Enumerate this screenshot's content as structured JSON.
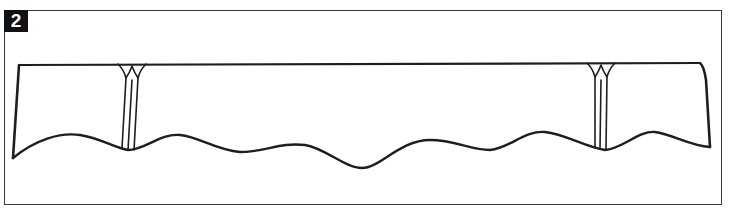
{
  "figure": {
    "step_number": "2",
    "colors": {
      "ink": "#1e1e1e",
      "frame": "#3a3a3a",
      "badge_bg": "#111111",
      "badge_text": "#ffffff",
      "background": "#ffffff"
    },
    "pleats": [
      {
        "name": "left-pleat",
        "x": 130
      },
      {
        "name": "right-pleat",
        "x": 600
      }
    ]
  }
}
